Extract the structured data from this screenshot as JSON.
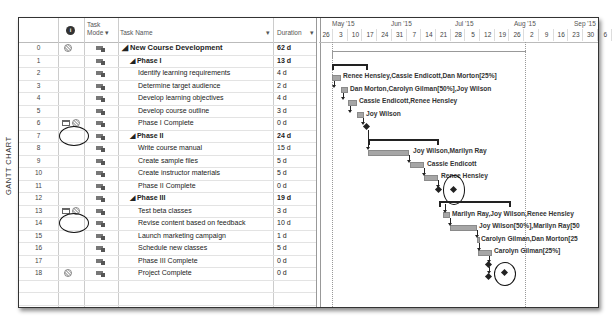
{
  "view_label": "GANTT CHART",
  "columns": {
    "info_icon": "info-icon",
    "task_mode": "Task Mode",
    "task_mode_line1": "Task",
    "task_mode_line2": "Mode ▾",
    "task_name": "Task Name",
    "task_name_arrow": "▾",
    "duration": "Duration",
    "duration_arrow": "▾"
  },
  "timescale": {
    "months": [
      {
        "label": "May '15",
        "x": 13
      },
      {
        "label": "Jun '15",
        "x": 72
      },
      {
        "label": "Jul '15",
        "x": 136
      },
      {
        "label": "Aug '15",
        "x": 195
      },
      {
        "label": "Sep '15",
        "x": 255
      }
    ],
    "weeks": [
      "26",
      "3",
      "10",
      "17",
      "24",
      "31",
      "7",
      "14",
      "21",
      "28",
      "5",
      "12",
      "19",
      "26",
      "2",
      "9",
      "16",
      "23",
      "30",
      "6"
    ]
  },
  "tasks": [
    {
      "id": "0",
      "name": "◢ New Course Development",
      "duration": "62 d",
      "level": 0,
      "bold": true,
      "indicator": "recurring"
    },
    {
      "id": "1",
      "name": "◢ Phase I",
      "duration": "13 d",
      "level": 1,
      "bold": true,
      "indicator": ""
    },
    {
      "id": "2",
      "name": "Identify learning requirements",
      "duration": "4 d",
      "level": 2,
      "bold": false,
      "indicator": ""
    },
    {
      "id": "3",
      "name": "Determine target audience",
      "duration": "2 d",
      "level": 2,
      "bold": false,
      "indicator": ""
    },
    {
      "id": "4",
      "name": "Develop learning objectives",
      "duration": "4 d",
      "level": 2,
      "bold": false,
      "indicator": ""
    },
    {
      "id": "5",
      "name": "Develop course outline",
      "duration": "3 d",
      "level": 2,
      "bold": false,
      "indicator": ""
    },
    {
      "id": "6",
      "name": "Phase I Complete",
      "duration": "0 d",
      "level": 2,
      "bold": false,
      "indicator": "note+recurring"
    },
    {
      "id": "7",
      "name": "◢ Phase II",
      "duration": "24 d",
      "level": 1,
      "bold": true,
      "indicator": ""
    },
    {
      "id": "8",
      "name": "Write course manual",
      "duration": "15 d",
      "level": 2,
      "bold": false,
      "indicator": ""
    },
    {
      "id": "9",
      "name": "Create sample files",
      "duration": "5 d",
      "level": 2,
      "bold": false,
      "indicator": ""
    },
    {
      "id": "10",
      "name": "Create instructor materials",
      "duration": "5 d",
      "level": 2,
      "bold": false,
      "indicator": ""
    },
    {
      "id": "11",
      "name": "Phase II Complete",
      "duration": "0 d",
      "level": 2,
      "bold": false,
      "indicator": ""
    },
    {
      "id": "12",
      "name": "◢ Phase III",
      "duration": "19 d",
      "level": 1,
      "bold": true,
      "indicator": ""
    },
    {
      "id": "13",
      "name": "Test beta classes",
      "duration": "3 d",
      "level": 2,
      "bold": false,
      "indicator": "note+recurring"
    },
    {
      "id": "14",
      "name": "Revise content based on feedback",
      "duration": "10 d",
      "level": 2,
      "bold": false,
      "indicator": ""
    },
    {
      "id": "15",
      "name": "Launch marketing campaign",
      "duration": "1 d",
      "level": 2,
      "bold": false,
      "indicator": ""
    },
    {
      "id": "16",
      "name": "Schedule new classes",
      "duration": "5 d",
      "level": 2,
      "bold": false,
      "indicator": ""
    },
    {
      "id": "17",
      "name": "Phase III Complete",
      "duration": "0 d",
      "level": 2,
      "bold": false,
      "indicator": ""
    },
    {
      "id": "18",
      "name": "Project Complete",
      "duration": "0 d",
      "level": 2,
      "bold": false,
      "indicator": "recurring"
    }
  ],
  "resources": {
    "r2": "Renee Hensley,Cassie Endicott,Dan Morton[25%]",
    "r3": "Dan Morton,Carolyn Gilman[50%],Joy Wilson",
    "r4": "Cassie Endicott,Renee Hensley",
    "r5": "Joy Wilson",
    "r8": "Joy Wilson,Marilyn Ray",
    "r9": "Cassie Endicott",
    "r10": "Renee Hensley",
    "r13": "Marilyn Ray,Joy Wilson,Renee Hensley",
    "r14": "Joy Wilson[50%],Marilyn Ray[50",
    "r15": "Carolyn Gilman,Dan Morton[25",
    "r16": "Carolyn Gilman[25%]"
  }
}
